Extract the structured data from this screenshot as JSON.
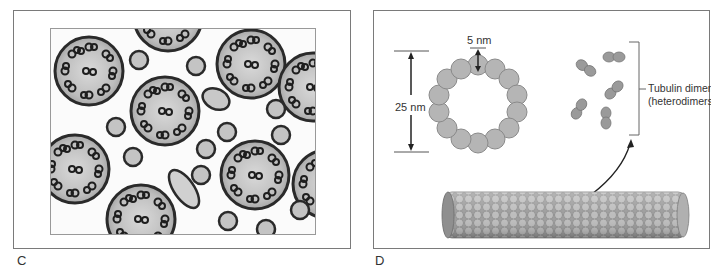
{
  "figure": {
    "panels": [
      {
        "id": "C",
        "label": "C",
        "content": "Electron micrograph cross-section of cilia/flagella axonemes (9+2 microtubule arrangement)"
      },
      {
        "id": "D",
        "label": "D",
        "content": "Microtubule structure diagram",
        "annotations": {
          "diameter_label": "25 nm",
          "subunit_label": "5 nm",
          "dimers_label_line1": "Tubulin dimers",
          "dimers_label_line2": "(heterodimers)"
        },
        "ring_subunit_count": 13,
        "dimer_count": 5
      }
    ]
  },
  "colors": {
    "border": "#7a7a7a",
    "subunit_fill": "#b5b5b5",
    "subunit_stroke": "#8a8a8a",
    "dimer_fill": "#9a9a9a",
    "membrane": "#2a2a2a",
    "text": "#333333"
  }
}
